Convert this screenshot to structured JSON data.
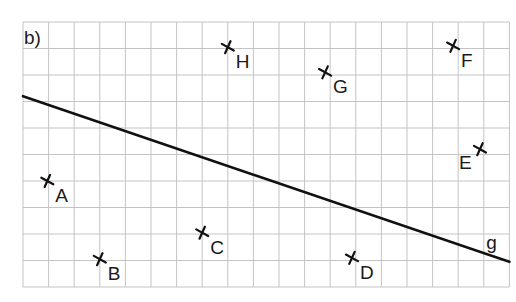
{
  "title": "b)",
  "grid": {
    "columns": 19,
    "rows": 10
  },
  "line": {
    "label": "g",
    "from": [
      0,
      7.2
    ],
    "to": [
      19,
      0.95
    ]
  },
  "points": [
    {
      "label": "A",
      "x": 0.95,
      "y": 4.0
    },
    {
      "label": "B",
      "x": 3.0,
      "y": 1.05
    },
    {
      "label": "C",
      "x": 7.0,
      "y": 2.05
    },
    {
      "label": "D",
      "x": 12.85,
      "y": 1.1
    },
    {
      "label": "E",
      "x": 17.85,
      "y": 5.2
    },
    {
      "label": "F",
      "x": 16.8,
      "y": 9.1
    },
    {
      "label": "G",
      "x": 11.8,
      "y": 8.1
    },
    {
      "label": "H",
      "x": 8.0,
      "y": 9.05
    }
  ],
  "colors": {
    "grid": "#c4c4c4",
    "ink": "#111111"
  }
}
